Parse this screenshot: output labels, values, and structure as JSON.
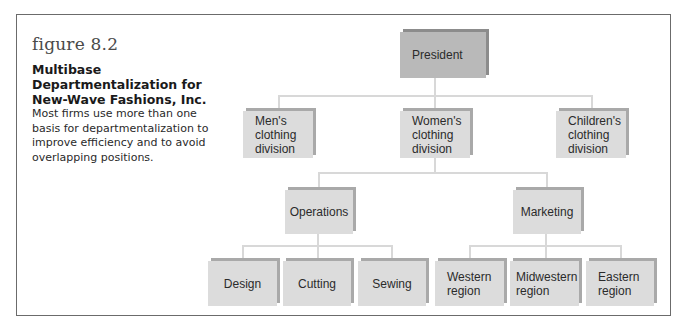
{
  "figure": {
    "label": "figure 8.2",
    "heading": "Multibase Departmentalization for New-Wave Fashions, Inc.",
    "description": "Most firms use more than one basis for departmentalization to improve efficiency and to avoid overlapping positions."
  },
  "page_corner": "...",
  "org_chart": {
    "top": {
      "label": "President"
    },
    "divisions": [
      {
        "label": "Men's\nclothing\ndivision"
      },
      {
        "label": "Women's\nclothing\ndivision"
      },
      {
        "label": "Children's\nclothing\ndivision"
      }
    ],
    "functions": [
      {
        "label": "Operations",
        "parent": "Women's clothing division"
      },
      {
        "label": "Marketing",
        "parent": "Women's clothing division"
      }
    ],
    "operations_units": [
      {
        "label": "Design"
      },
      {
        "label": "Cutting"
      },
      {
        "label": "Sewing"
      }
    ],
    "marketing_units": [
      {
        "label": "Western\nregion"
      },
      {
        "label": "Midwestern\nregion"
      },
      {
        "label": "Eastern\nregion"
      }
    ]
  },
  "colors": {
    "box_fill": "#dcdcdc",
    "box_shadow": "#a9a9a9",
    "president_fill": "#b9b9b9",
    "connector": "#d8d8d8",
    "frame_border": "#6b6b6b"
  }
}
